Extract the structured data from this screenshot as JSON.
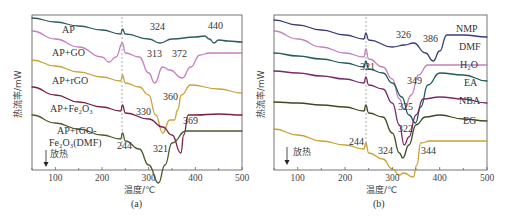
{
  "figure": {
    "panels": [
      "(a)",
      "(b)"
    ]
  },
  "chart_data": [
    {
      "type": "line",
      "panel_label": "(a)",
      "title": "",
      "xlabel": "温度/℃",
      "ylabel": "热流率/mW",
      "xlim": [
        50,
        500
      ],
      "xticks": [
        100,
        200,
        300,
        400,
        500
      ],
      "yticks": [],
      "grid": false,
      "direction_note": "放热",
      "dashed_reference_x": 244,
      "annotations": [
        {
          "text": "324",
          "x": 324,
          "series": "AP"
        },
        {
          "text": "440",
          "x": 440,
          "series": "AP"
        },
        {
          "text": "313",
          "x": 313,
          "series": "AP+GO"
        },
        {
          "text": "372",
          "x": 372,
          "series": "AP+GO"
        },
        {
          "text": "360",
          "x": 360,
          "series": "AP+rGO"
        },
        {
          "text": "330",
          "x": 330,
          "series": "AP+rGO"
        },
        {
          "text": "369",
          "x": 369,
          "series": "AP+Fe2O3"
        },
        {
          "text": "321",
          "x": 321,
          "series": "AP+rGO-Fe2O3(DMF)"
        },
        {
          "text": "244",
          "x": 244,
          "series": "all"
        }
      ],
      "series": [
        {
          "name": "AP",
          "color": "#2f5a5e",
          "points": [
            [
              50,
              3
            ],
            [
              100,
              7
            ],
            [
              150,
              11
            ],
            [
              200,
              15
            ],
            [
              240,
              19
            ],
            [
              244,
              14
            ],
            [
              250,
              19
            ],
            [
              300,
              24
            ],
            [
              324,
              28
            ],
            [
              350,
              24
            ],
            [
              400,
              22
            ],
            [
              420,
              21
            ],
            [
              430,
              24
            ],
            [
              440,
              28
            ],
            [
              450,
              25
            ],
            [
              470,
              26
            ],
            [
              500,
              27
            ]
          ]
        },
        {
          "name": "AP+GO",
          "color": "#c57fc0",
          "points": [
            [
              50,
              16
            ],
            [
              100,
              24
            ],
            [
              150,
              32
            ],
            [
              200,
              42
            ],
            [
              215,
              47
            ],
            [
              230,
              42
            ],
            [
              244,
              28
            ],
            [
              250,
              38
            ],
            [
              280,
              42
            ],
            [
              300,
              58
            ],
            [
              313,
              68
            ],
            [
              330,
              52
            ],
            [
              345,
              55
            ],
            [
              372,
              63
            ],
            [
              390,
              52
            ],
            [
              410,
              40
            ],
            [
              430,
              38
            ],
            [
              500,
              38
            ]
          ]
        },
        {
          "name": "AP+rGO",
          "color": "#c9a23a",
          "points": [
            [
              50,
              45
            ],
            [
              100,
              51
            ],
            [
              150,
              57
            ],
            [
              200,
              62
            ],
            [
              240,
              66
            ],
            [
              244,
              60
            ],
            [
              250,
              68
            ],
            [
              280,
              72
            ],
            [
              300,
              80
            ],
            [
              315,
              100
            ],
            [
              330,
              118
            ],
            [
              345,
              105
            ],
            [
              355,
              105
            ],
            [
              362,
              95
            ],
            [
              370,
              80
            ],
            [
              390,
              70
            ],
            [
              450,
              74
            ],
            [
              500,
              78
            ]
          ]
        },
        {
          "name": "AP+Fe2O3",
          "color": "#7a1f45",
          "points": [
            [
              50,
              72
            ],
            [
              100,
              80
            ],
            [
              150,
              87
            ],
            [
              200,
              92
            ],
            [
              240,
              96
            ],
            [
              244,
              90
            ],
            [
              250,
              98
            ],
            [
              300,
              104
            ],
            [
              330,
              112
            ],
            [
              350,
              120
            ],
            [
              369,
              138
            ],
            [
              375,
              120
            ],
            [
              385,
              100
            ],
            [
              400,
              100
            ],
            [
              450,
              99
            ],
            [
              500,
              100
            ]
          ]
        },
        {
          "name": "AP+rGO-Fe2O3(DMF)",
          "color": "#4b5a2a",
          "points": [
            [
              50,
              100
            ],
            [
              100,
              108
            ],
            [
              150,
              114
            ],
            [
              200,
              120
            ],
            [
              240,
              124
            ],
            [
              244,
              118
            ],
            [
              250,
              126
            ],
            [
              280,
              134
            ],
            [
              300,
              150
            ],
            [
              321,
              168
            ],
            [
              335,
              150
            ],
            [
              350,
              128
            ],
            [
              380,
              116
            ],
            [
              420,
              116
            ],
            [
              500,
              116
            ]
          ]
        }
      ]
    },
    {
      "type": "line",
      "panel_label": "(b)",
      "title": "",
      "xlabel": "温度/℃",
      "ylabel": "热流率/mW",
      "xlim": [
        50,
        500
      ],
      "xticks": [
        100,
        200,
        300,
        400,
        500
      ],
      "yticks": [],
      "grid": false,
      "direction_note": "放热",
      "dashed_reference_x": 244,
      "annotations": [
        {
          "text": "326",
          "x": 326,
          "series": "NMP"
        },
        {
          "text": "386",
          "x": 386,
          "series": "NMP"
        },
        {
          "text": "321",
          "x": 321,
          "series": "DMF"
        },
        {
          "text": "349",
          "x": 349,
          "series": "H2O"
        },
        {
          "text": "325",
          "x": 325,
          "series": "EA"
        },
        {
          "text": "322",
          "x": 322,
          "series": "NBA"
        },
        {
          "text": "324",
          "x": 324,
          "series": "EG"
        },
        {
          "text": "344",
          "x": 344,
          "series": "EG"
        },
        {
          "text": "244",
          "x": 244,
          "series": "all"
        }
      ],
      "series": [
        {
          "name": "NMP",
          "color": "#3b3d7a",
          "points": [
            [
              50,
              5
            ],
            [
              100,
              10
            ],
            [
              150,
              15
            ],
            [
              200,
              20
            ],
            [
              240,
              24
            ],
            [
              244,
              18
            ],
            [
              250,
              25
            ],
            [
              300,
              32
            ],
            [
              326,
              30
            ],
            [
              345,
              28
            ],
            [
              370,
              38
            ],
            [
              386,
              46
            ],
            [
              400,
              36
            ],
            [
              415,
              20
            ],
            [
              450,
              20
            ],
            [
              500,
              22
            ]
          ]
        },
        {
          "name": "DMF",
          "color": "#c184bb",
          "points": [
            [
              50,
              16
            ],
            [
              100,
              24
            ],
            [
              150,
              32
            ],
            [
              200,
              38
            ],
            [
              240,
              42
            ],
            [
              244,
              34
            ],
            [
              250,
              44
            ],
            [
              280,
              52
            ],
            [
              300,
              64
            ],
            [
              315,
              84
            ],
            [
              325,
              94
            ],
            [
              340,
              80
            ],
            [
              355,
              60
            ],
            [
              375,
              50
            ],
            [
              400,
              50
            ],
            [
              500,
              50
            ]
          ]
        },
        {
          "name": "H2O",
          "color": "#1f5c5a",
          "points": [
            [
              50,
              38
            ],
            [
              100,
              41
            ],
            [
              150,
              44
            ],
            [
              200,
              48
            ],
            [
              240,
              52
            ],
            [
              244,
              46
            ],
            [
              250,
              54
            ],
            [
              280,
              58
            ],
            [
              300,
              68
            ],
            [
              320,
              82
            ],
            [
              335,
              100
            ],
            [
              349,
              108
            ],
            [
              360,
              92
            ],
            [
              375,
              70
            ],
            [
              400,
              58
            ],
            [
              450,
              60
            ],
            [
              500,
              66
            ]
          ]
        },
        {
          "name": "EA",
          "color": "#7a2a6a",
          "points": [
            [
              50,
              56
            ],
            [
              100,
              58
            ],
            [
              150,
              61
            ],
            [
              200,
              64
            ],
            [
              240,
              68
            ],
            [
              244,
              62
            ],
            [
              250,
              70
            ],
            [
              280,
              74
            ],
            [
              300,
              88
            ],
            [
              315,
              110
            ],
            [
              325,
              130
            ],
            [
              335,
              122
            ],
            [
              350,
              100
            ],
            [
              365,
              84
            ],
            [
              400,
              82
            ],
            [
              450,
              84
            ],
            [
              500,
              88
            ]
          ]
        },
        {
          "name": "NBA",
          "color": "#3e4a22",
          "points": [
            [
              50,
              87
            ],
            [
              100,
              88
            ],
            [
              150,
              90
            ],
            [
              200,
              92
            ],
            [
              240,
              96
            ],
            [
              244,
              90
            ],
            [
              250,
              98
            ],
            [
              280,
              102
            ],
            [
              300,
              118
            ],
            [
              315,
              138
            ],
            [
              322,
              143
            ],
            [
              335,
              130
            ],
            [
              350,
              110
            ],
            [
              370,
              102
            ],
            [
              400,
              100
            ],
            [
              450,
              104
            ],
            [
              500,
              106
            ]
          ]
        },
        {
          "name": "EG",
          "color": "#c9a22f",
          "points": [
            [
              50,
              114
            ],
            [
              100,
              120
            ],
            [
              150,
              126
            ],
            [
              200,
              130
            ],
            [
              240,
              134
            ],
            [
              244,
              128
            ],
            [
              250,
              138
            ],
            [
              280,
              144
            ],
            [
              300,
              154
            ],
            [
              315,
              160
            ],
            [
              324,
              158
            ],
            [
              344,
              162
            ],
            [
              352,
              150
            ],
            [
              360,
              128
            ],
            [
              380,
              126
            ],
            [
              450,
              126
            ],
            [
              500,
              126
            ]
          ]
        }
      ]
    }
  ],
  "labels": {
    "a": {
      "series_labels": [
        "AP",
        "AP+GO",
        "AP+rGO",
        "AP+Fe₂O₃",
        "AP+rGO-",
        "Fe₂O₃(DMF)"
      ],
      "ylabel": "热流率/mW",
      "xlabel": "温度/℃",
      "note": "放热",
      "panel": "(a)",
      "ticks": [
        "100",
        "200",
        "300",
        "400",
        "500"
      ],
      "peaks": [
        "324",
        "440",
        "313",
        "372",
        "360",
        "330",
        "369",
        "321",
        "244"
      ]
    },
    "b": {
      "series_labels": [
        "NMP",
        "DMF",
        "H₂O",
        "EA",
        "NBA",
        "EG"
      ],
      "ylabel": "热流率/mW",
      "xlabel": "温度/℃",
      "note": "放热",
      "panel": "(b)",
      "ticks": [
        "100",
        "200",
        "300",
        "400",
        "500"
      ],
      "peaks": [
        "326",
        "386",
        "321",
        "349",
        "325",
        "322",
        "324",
        "344",
        "244"
      ]
    }
  }
}
